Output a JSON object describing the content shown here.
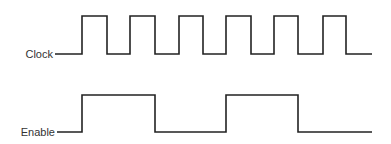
{
  "diagram": {
    "type": "timing-diagram",
    "signals": [
      {
        "name": "Clock",
        "label": "Clock",
        "high_y": 16,
        "low_y": 54,
        "start_x": 55,
        "end_x": 372,
        "initial_level": "low",
        "transitions_x": [
          82,
          107,
          130,
          155,
          179,
          203,
          226,
          251,
          274,
          298,
          323,
          346
        ]
      },
      {
        "name": "Enable",
        "label": "Enable",
        "high_y": 95,
        "low_y": 132,
        "start_x": 57,
        "end_x": 372,
        "initial_level": "low",
        "transitions_x": [
          82,
          155,
          226,
          298
        ]
      }
    ],
    "stroke_color": "#222222",
    "label_color": "#333333"
  }
}
